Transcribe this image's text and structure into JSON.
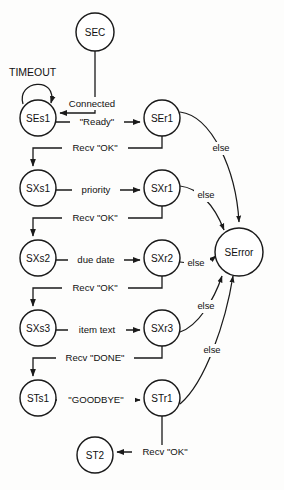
{
  "diagram": {
    "canvas": {
      "width": 284,
      "height": 490
    },
    "stroke_color": "#1a1a1a",
    "background_color": "#fdfdfc",
    "states": [
      {
        "id": "SEC",
        "label": "SEC",
        "cx": 95,
        "cy": 32,
        "r": 19
      },
      {
        "id": "SEs1",
        "label": "SEs1",
        "cx": 38,
        "cy": 118,
        "r": 18
      },
      {
        "id": "SEr1",
        "label": "SEr1",
        "cx": 162,
        "cy": 118,
        "r": 18
      },
      {
        "id": "SXs1",
        "label": "SXs1",
        "cx": 38,
        "cy": 188,
        "r": 18
      },
      {
        "id": "SXr1",
        "label": "SXr1",
        "cx": 162,
        "cy": 188,
        "r": 18
      },
      {
        "id": "SXs2",
        "label": "SXs2",
        "cx": 38,
        "cy": 258,
        "r": 18
      },
      {
        "id": "SXr2",
        "label": "SXr2",
        "cx": 162,
        "cy": 258,
        "r": 18
      },
      {
        "id": "SXs3",
        "label": "SXs3",
        "cx": 38,
        "cy": 328,
        "r": 18
      },
      {
        "id": "SXr3",
        "label": "SXr3",
        "cx": 162,
        "cy": 328,
        "r": 18
      },
      {
        "id": "STs1",
        "label": "STs1",
        "cx": 38,
        "cy": 398,
        "r": 18
      },
      {
        "id": "STr1",
        "label": "STr1",
        "cx": 162,
        "cy": 398,
        "r": 18
      },
      {
        "id": "ST2",
        "label": "ST2",
        "cx": 95,
        "cy": 455,
        "r": 18
      },
      {
        "id": "SError",
        "label": "SError",
        "cx": 239,
        "cy": 252,
        "r": 24
      }
    ],
    "transitions": [
      {
        "id": "t-timeout",
        "from": "SEs1",
        "to": "SEs1",
        "label": "TIMEOUT"
      },
      {
        "id": "t-connected",
        "from": "SEC",
        "to": "SEs1",
        "label": "Connected"
      },
      {
        "id": "t-ready",
        "from": "SEs1",
        "to": "SEr1",
        "label": "\"Ready\""
      },
      {
        "id": "t-ok-1",
        "from": "SEr1",
        "to": "SXs1",
        "label": "Recv \"OK\""
      },
      {
        "id": "t-priority",
        "from": "SXs1",
        "to": "SXr1",
        "label": "priority"
      },
      {
        "id": "t-ok-2",
        "from": "SXr1",
        "to": "SXs2",
        "label": "Recv \"OK\""
      },
      {
        "id": "t-due-date",
        "from": "SXs2",
        "to": "SXr2",
        "label": "due date"
      },
      {
        "id": "t-ok-3",
        "from": "SXr2",
        "to": "SXs3",
        "label": "Recv \"OK\""
      },
      {
        "id": "t-item-text",
        "from": "SXs3",
        "to": "SXr3",
        "label": "item text"
      },
      {
        "id": "t-done",
        "from": "SXr3",
        "to": "STs1",
        "label": "Recv \"DONE\""
      },
      {
        "id": "t-goodbye",
        "from": "STs1",
        "to": "STr1",
        "label": "\"GOODBYE\""
      },
      {
        "id": "t-ok-4",
        "from": "STr1",
        "to": "ST2",
        "label": "Recv \"OK\""
      },
      {
        "id": "t-else-1",
        "from": "SEr1",
        "to": "SError",
        "label": "else",
        "label_x": 221,
        "label_y": 149
      },
      {
        "id": "t-else-2",
        "from": "SXr1",
        "to": "SError",
        "label": "else",
        "label_x": 206,
        "label_y": 196
      },
      {
        "id": "t-else-3",
        "from": "SXr2",
        "to": "SError",
        "label": "else",
        "label_x": 196,
        "label_y": 264
      },
      {
        "id": "t-else-4",
        "from": "SXr3",
        "to": "SError",
        "label": "else",
        "label_x": 206,
        "label_y": 307
      },
      {
        "id": "t-else-5",
        "from": "STr1",
        "to": "SError",
        "label": "else",
        "label_x": 212,
        "label_y": 351
      }
    ]
  }
}
